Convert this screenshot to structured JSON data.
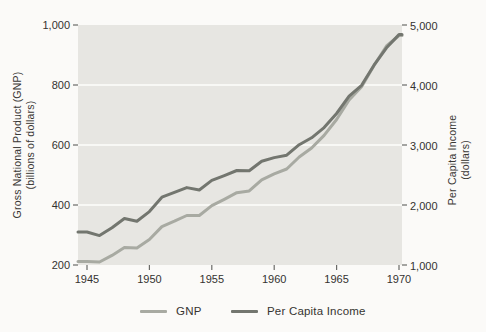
{
  "figure": {
    "bg_color": "#fbfaf8",
    "plot_bg_color": "#e7e6e2",
    "gridline_color": "#f8f8f5",
    "tick_color": "#6b6b68",
    "text_color": "#33312e"
  },
  "chart_data": {
    "type": "line",
    "title": "",
    "x": [
      1945,
      1946,
      1947,
      1948,
      1949,
      1950,
      1951,
      1952,
      1953,
      1954,
      1955,
      1956,
      1957,
      1958,
      1959,
      1960,
      1961,
      1962,
      1963,
      1964,
      1965,
      1966,
      1967,
      1968,
      1969,
      1970
    ],
    "x_tick_labels": [
      "1945",
      "1950",
      "1955",
      "1960",
      "1965",
      "1970"
    ],
    "x_tick_years": [
      1945,
      1950,
      1955,
      1960,
      1965,
      1970
    ],
    "left_axis": {
      "title_line1": "Gross National Product (GNP)",
      "title_line2": "(billions of dollars)",
      "tick_labels": [
        "200",
        "400",
        "600",
        "800",
        "1,000"
      ],
      "range": [
        200,
        1000
      ]
    },
    "right_axis": {
      "title_line1": "Per Capita Income",
      "title_line2": "(dollars)",
      "tick_labels": [
        "1,000",
        "2,000",
        "3,000",
        "4,000",
        "5,000"
      ],
      "range": [
        1000,
        5000
      ]
    },
    "grid": "horizontal-white",
    "legend_position": "bottom",
    "series": [
      {
        "name": "GNP",
        "axis": "left",
        "color": "#a8aaa2",
        "values": [
          212,
          210,
          232,
          258,
          257,
          285,
          328,
          346,
          365,
          365,
          398,
          419,
          441,
          447,
          484,
          504,
          520,
          560,
          590,
          632,
          685,
          750,
          794,
          865,
          930,
          965
        ]
      },
      {
        "name": "Per Capita Income",
        "axis": "right",
        "color": "#73766f",
        "values": [
          1550,
          1490,
          1620,
          1775,
          1730,
          1890,
          2130,
          2210,
          2290,
          2250,
          2410,
          2490,
          2575,
          2570,
          2730,
          2790,
          2830,
          3005,
          3120,
          3290,
          3525,
          3815,
          3995,
          4330,
          4620,
          4840
        ]
      }
    ]
  }
}
